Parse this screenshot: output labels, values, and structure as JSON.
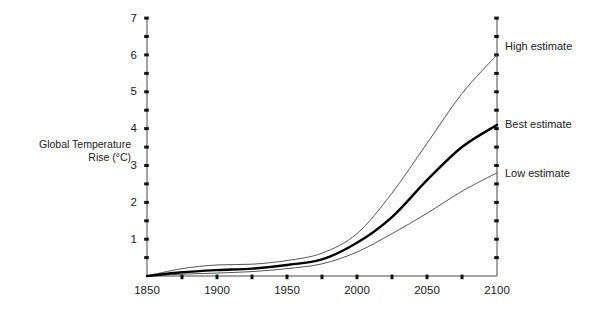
{
  "chart_data": {
    "type": "line",
    "title": "",
    "xlabel": "",
    "ylabel": "Global Temperature Rise (°C)",
    "ylabel_line1": "Global Temperature",
    "ylabel_line2": "Rise (°C)",
    "xlim": [
      1850,
      2100
    ],
    "ylim": [
      0,
      7
    ],
    "grid": false,
    "legend_position": "inline-right-end",
    "x_tick_labels": [
      "1850",
      "1900",
      "1950",
      "2000",
      "2050",
      "2100"
    ],
    "x_tick_values": [
      1850,
      1900,
      1950,
      2000,
      2050,
      2100
    ],
    "x_minor_tick_values": [
      1875,
      1925,
      1975,
      2025,
      2075
    ],
    "y_tick_labels": [
      "1",
      "2",
      "3",
      "4",
      "5",
      "6",
      "7"
    ],
    "y_tick_values": [
      1,
      2,
      3,
      4,
      5,
      6,
      7
    ],
    "y_minor_tick_values": [
      0.5,
      1.5,
      2.5,
      3.5,
      4.5,
      5.5,
      6.5
    ],
    "x": [
      1850,
      1875,
      1900,
      1925,
      1950,
      1975,
      2000,
      2025,
      2050,
      2075,
      2100
    ],
    "series": [
      {
        "name": "High estimate",
        "label": "High estimate",
        "color": "#555555",
        "width": "thin",
        "values": [
          0.0,
          0.2,
          0.3,
          0.32,
          0.42,
          0.62,
          1.15,
          2.25,
          3.6,
          4.95,
          6.0
        ]
      },
      {
        "name": "Best estimate",
        "label": "Best estimate",
        "color": "#000000",
        "width": "thick",
        "values": [
          0.0,
          0.1,
          0.16,
          0.2,
          0.3,
          0.45,
          0.9,
          1.6,
          2.6,
          3.5,
          4.1
        ]
      },
      {
        "name": "Low estimate",
        "label": "Low estimate",
        "color": "#555555",
        "width": "thin",
        "values": [
          0.0,
          0.05,
          0.08,
          0.12,
          0.2,
          0.33,
          0.65,
          1.15,
          1.7,
          2.3,
          2.8
        ]
      }
    ]
  },
  "labels": {
    "y_axis_title_line1": "Global Temperature",
    "y_axis_title_line2": "Rise (°C)",
    "high_estimate": "High estimate",
    "best_estimate": "Best estimate",
    "low_estimate": "Low estimate",
    "x_1850": "1850",
    "x_1900": "1900",
    "x_1950": "1950",
    "x_2000": "2000",
    "x_2050": "2050",
    "x_2100": "2100",
    "y_1": "1",
    "y_2": "2",
    "y_3": "3",
    "y_4": "4",
    "y_5": "5",
    "y_6": "6",
    "y_7": "7"
  },
  "colors": {
    "background": "#ffffff",
    "axis": "#4a4a4a",
    "text": "#1a1a1a",
    "thin_series": "#555555",
    "thick_series": "#000000"
  }
}
